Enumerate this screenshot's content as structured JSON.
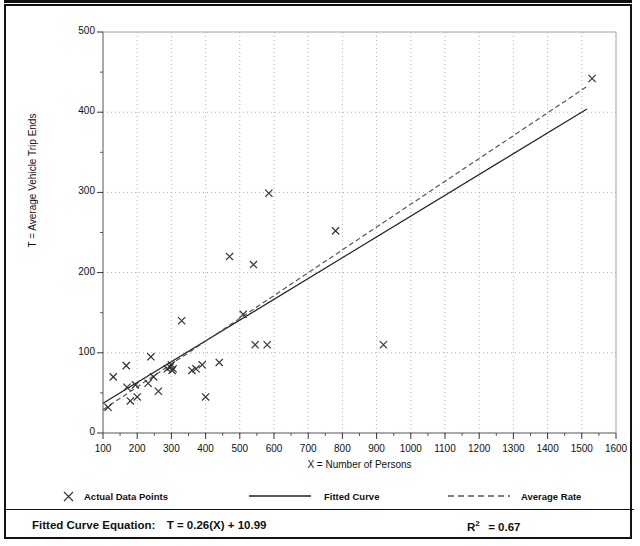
{
  "chart_data": {
    "type": "scatter",
    "title": "",
    "xlabel": "X = Number of Persons",
    "ylabel": "T = Average Vehicle Trip Ends",
    "xlim": [
      100,
      1600
    ],
    "ylim": [
      0,
      500
    ],
    "xticks": [
      100,
      200,
      300,
      400,
      500,
      600,
      700,
      800,
      900,
      1000,
      1100,
      1200,
      1300,
      1400,
      1500,
      1600
    ],
    "yticks": [
      0,
      100,
      200,
      300,
      400,
      500
    ],
    "x_minor_tick_step": 50,
    "y_minor_tick_step": 50,
    "grid": true,
    "grid_style": "dotted",
    "legend_position": "below-plot",
    "series": [
      {
        "name": "Actual Data Points",
        "type": "scatter",
        "marker": "x",
        "color": "#333333",
        "points": [
          [
            115,
            32
          ],
          [
            130,
            70
          ],
          [
            168,
            84
          ],
          [
            170,
            57
          ],
          [
            180,
            40
          ],
          [
            195,
            60
          ],
          [
            200,
            45
          ],
          [
            232,
            62
          ],
          [
            240,
            95
          ],
          [
            248,
            70
          ],
          [
            262,
            52
          ],
          [
            288,
            80
          ],
          [
            296,
            82
          ],
          [
            300,
            85
          ],
          [
            302,
            78
          ],
          [
            305,
            80
          ],
          [
            330,
            140
          ],
          [
            360,
            78
          ],
          [
            372,
            80
          ],
          [
            390,
            85
          ],
          [
            400,
            45
          ],
          [
            440,
            88
          ],
          [
            470,
            220
          ],
          [
            510,
            148
          ],
          [
            540,
            210
          ],
          [
            545,
            110
          ],
          [
            580,
            110
          ],
          [
            585,
            299
          ],
          [
            780,
            252
          ],
          [
            920,
            110
          ],
          [
            1530,
            442
          ]
        ]
      },
      {
        "name": "Fitted Curve",
        "type": "line",
        "style": "solid",
        "color": "#222222",
        "equation": "T = 0.26(X) + 10.99",
        "slope": 0.26,
        "intercept": 10.99,
        "x_start": 100,
        "x_end": 1515,
        "y_start": 37,
        "y_end": 404
      },
      {
        "name": "Average Rate",
        "type": "line",
        "style": "dashed",
        "color": "#555555",
        "x_start": 100,
        "x_end": 1515,
        "y_start": 29,
        "y_end": 432
      }
    ]
  },
  "legend": {
    "items": [
      {
        "label": "Actual Data Points",
        "symbol": "x-marker"
      },
      {
        "label": "Fitted Curve",
        "symbol": "solid-line"
      },
      {
        "label": "Average Rate",
        "symbol": "dashed-line"
      }
    ]
  },
  "footer": {
    "equation_label": "Fitted Curve Equation:",
    "equation_value": "T = 0.26(X) + 10.99",
    "r2_label": "R",
    "r2_exponent": "2",
    "r2_value": "= 0.67"
  }
}
